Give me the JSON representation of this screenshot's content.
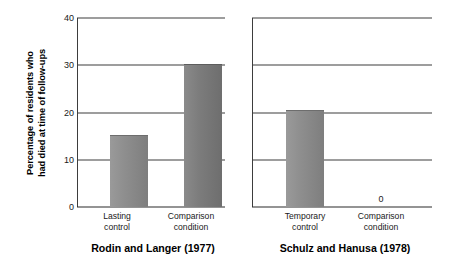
{
  "chart_data": {
    "type": "bar",
    "title": "",
    "subtitle": "",
    "xlabel": "",
    "ylabel_line1": "Percentage of residents who",
    "ylabel_line2": "had died at time of follow-ups",
    "ylim": [
      0,
      40
    ],
    "yticks": [
      40,
      30,
      20,
      10,
      0
    ],
    "ytick_labels": [
      "40",
      "30",
      "20",
      "10",
      "0"
    ],
    "grid": true,
    "legend": "none",
    "panels": [
      {
        "caption": "Rodin and Langer (1977)",
        "show_ytick_labels": true,
        "categories": [
          "Lasting control",
          "Comparison condition"
        ],
        "category_lines": [
          [
            "Lasting",
            "control"
          ],
          [
            "Comparison",
            "condition"
          ]
        ],
        "values": [
          15.2,
          30.3
        ],
        "value_annotations": [
          "",
          ""
        ]
      },
      {
        "caption": "Schulz and Hanusa (1978)",
        "show_ytick_labels": false,
        "categories": [
          "Temporary control",
          "Comparison condition"
        ],
        "category_lines": [
          [
            "Temporary",
            "control"
          ],
          [
            "Comparison",
            "condition"
          ]
        ],
        "values": [
          20.5,
          0
        ],
        "value_annotations": [
          "",
          "0"
        ]
      }
    ],
    "colors": {
      "bar_light": "#8f8f8f",
      "bar_dark": "#7c7c7c",
      "axis": "#3d3d3d",
      "text": "#1a1a1a",
      "background": "#ffffff"
    }
  }
}
